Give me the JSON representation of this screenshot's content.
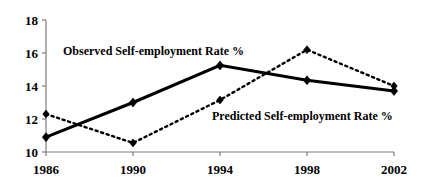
{
  "chart_data": {
    "type": "line",
    "title": "",
    "subtitle": "",
    "xlabel": "",
    "ylabel": "",
    "categories": [
      "1986",
      "1990",
      "1994",
      "1998",
      "2002"
    ],
    "x": [
      1986,
      1990,
      1994,
      1998,
      2002
    ],
    "xlim": [
      1986,
      2002
    ],
    "ylim": [
      10,
      18
    ],
    "y_ticks": [
      10,
      12,
      14,
      16,
      18
    ],
    "y_tick_labels": [
      "10",
      "12",
      "14",
      "16",
      "18"
    ],
    "x_ticks": [
      1986,
      1990,
      1994,
      1998,
      2002
    ],
    "x_tick_labels": [
      "1986",
      "1990",
      "1994",
      "1998",
      "2002"
    ],
    "grid": false,
    "legend_position": "inline-annotation",
    "series": [
      {
        "name": "Observed Self-employment Rate %",
        "values": [
          10.9,
          13.0,
          15.25,
          14.35,
          13.7
        ],
        "line_style": "solid",
        "line_width": 3,
        "color": "#000000",
        "marker": "diamond",
        "marker_size": 9,
        "annotation": {
          "text": "Observed Self-employment Rate %",
          "x_px": 63,
          "y_px": 45
        }
      },
      {
        "name": "Predicted Self-employment Rate %",
        "values": [
          12.3,
          10.55,
          13.15,
          16.2,
          14.0
        ],
        "line_style": "dotted",
        "line_width": 2.4,
        "color": "#000000",
        "marker": "diamond",
        "marker_size": 8,
        "annotation": {
          "text": "Predicted Self-employment Rate %",
          "x_px": 212,
          "y_px": 110
        }
      }
    ],
    "axis": {
      "color": "#7f7f7f",
      "x_axis_y_px": 152,
      "y_axis_x_px": 46,
      "plot_left_px": 46,
      "plot_right_px": 394,
      "plot_top_px": 20,
      "plot_bottom_px": 152
    }
  }
}
